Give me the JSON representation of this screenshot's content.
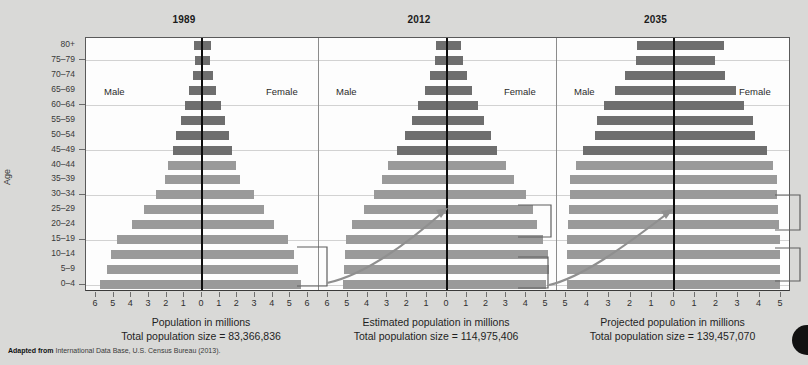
{
  "figure": {
    "age_axis_title": "Age",
    "source_prefix": "Adapted from",
    "source_text": "International Data Base, U.S. Census Bureau (2013)."
  },
  "age_groups": [
    "80+",
    "75–79",
    "70–74",
    "65–69",
    "60–64",
    "55–59",
    "50–54",
    "45–49",
    "40–44",
    "35–39",
    "30–34",
    "25–29",
    "20–24",
    "15–19",
    "10–14",
    "5–9",
    "0–4"
  ],
  "labels": {
    "male": "Male",
    "female": "Female"
  },
  "colors": {
    "bar_dark": "#6e6e6e",
    "bar_light": "#9a9a9a",
    "center_line": "#0d0d0d",
    "grid": "#d2d2d2",
    "frame": "#5a5a5a",
    "page_bg": "#d9d9d7",
    "plot_bg": "#fdfdfd",
    "arrow": "#8a8a8a",
    "callout": "#5f5f5f"
  },
  "chart_data": {
    "type": "bar",
    "subtype": "population-pyramid",
    "ylabel": "Age",
    "categories": [
      "80+",
      "75–79",
      "70–74",
      "65–69",
      "60–64",
      "55–59",
      "50–54",
      "45–49",
      "40–44",
      "35–39",
      "30–34",
      "25–29",
      "20–24",
      "15–19",
      "10–14",
      "5–9",
      "0–4"
    ],
    "grid": true,
    "legend": [
      "Male",
      "Female"
    ],
    "legend_position": "inside-top",
    "panels": [
      {
        "year": "1989",
        "xlabel": "Population in millions",
        "total_label": "Total population size = 83,366,836",
        "total_population": 83366836,
        "xlim": [
          -6,
          6
        ],
        "xticks": [
          6,
          5,
          4,
          3,
          2,
          1,
          0,
          1,
          2,
          3,
          4,
          5,
          6
        ],
        "series": [
          {
            "name": "Male",
            "values": [
              0.45,
              0.38,
              0.52,
              0.72,
              0.95,
              1.18,
              1.45,
              1.62,
              1.9,
              2.1,
              2.6,
              3.3,
              3.95,
              4.8,
              5.15,
              5.4,
              5.8
            ]
          },
          {
            "name": "Female",
            "values": [
              0.52,
              0.45,
              0.62,
              0.82,
              1.05,
              1.28,
              1.55,
              1.7,
              1.92,
              2.15,
              2.95,
              3.5,
              4.1,
              4.85,
              5.2,
              5.45,
              5.6
            ]
          }
        ]
      },
      {
        "year": "2012",
        "xlabel": "Estimated population in millions",
        "total_label": "Total population size = 114,975,406",
        "total_population": 114975406,
        "xlim": [
          -6,
          5
        ],
        "xticks": [
          6,
          5,
          4,
          3,
          2,
          1,
          0,
          1,
          2,
          3,
          4,
          5
        ],
        "series": [
          {
            "name": "Male",
            "values": [
              0.55,
              0.62,
              0.85,
              1.1,
              1.45,
              1.75,
              2.1,
              2.5,
              2.95,
              3.3,
              3.7,
              4.2,
              4.8,
              5.1,
              5.15,
              5.2,
              5.25
            ]
          },
          {
            "name": "Female",
            "values": [
              0.72,
              0.8,
              1.0,
              1.25,
              1.55,
              1.85,
              2.2,
              2.55,
              3.0,
              3.4,
              4.0,
              4.35,
              4.55,
              4.85,
              5.1,
              5.15,
              5.0
            ]
          }
        ]
      },
      {
        "year": "2035",
        "xlabel": "Projected population in millions",
        "total_label": "Total population size = 139,457,070",
        "total_population": 139457070,
        "xlim": [
          -5,
          5
        ],
        "xticks": [
          5,
          4,
          3,
          2,
          1,
          0,
          1,
          2,
          3,
          4,
          5
        ],
        "series": [
          {
            "name": "Male",
            "values": [
              1.7,
              1.75,
              2.25,
              2.7,
              3.25,
              3.55,
              3.65,
              4.2,
              4.55,
              4.8,
              4.8,
              4.85,
              4.9,
              4.95,
              4.95,
              4.95,
              4.95
            ]
          },
          {
            "name": "Female",
            "values": [
              2.35,
              1.95,
              2.4,
              2.9,
              3.3,
              3.7,
              3.8,
              4.35,
              4.65,
              4.8,
              4.8,
              4.85,
              4.9,
              4.95,
              4.95,
              4.95,
              4.95
            ]
          }
        ]
      }
    ]
  }
}
